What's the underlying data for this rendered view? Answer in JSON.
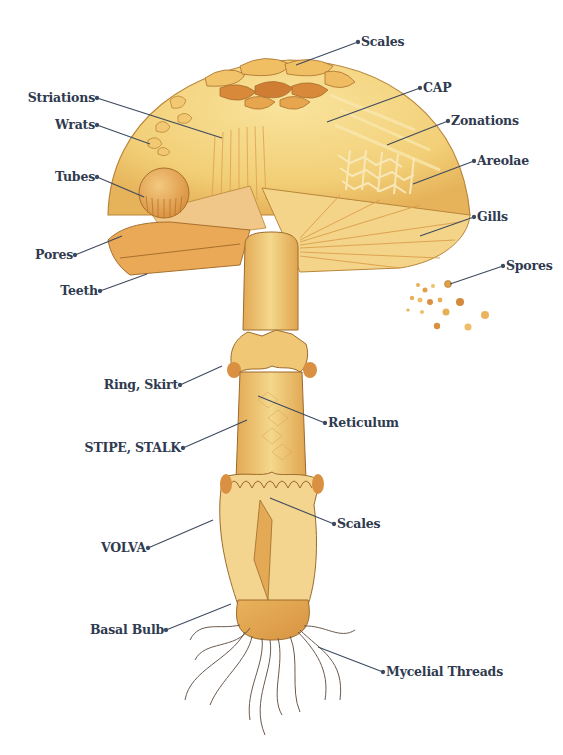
{
  "diagram": {
    "colors": {
      "label_text": "#2f3a4f",
      "leader_line": "#3d4a60",
      "cap_light": "#f7dc8e",
      "cap_mid": "#efc66a",
      "cap_dark": "#d99a45",
      "scale_brown": "#c7772e",
      "stipe": "#eec676",
      "root": "#6b5a4e"
    },
    "labels": [
      {
        "id": "scales-cap",
        "text": "Scales",
        "side": "right"
      },
      {
        "id": "cap",
        "text": "CAP",
        "side": "right"
      },
      {
        "id": "striations",
        "text": "Striations",
        "side": "left"
      },
      {
        "id": "wrats",
        "text": "Wrats",
        "side": "left"
      },
      {
        "id": "zonations",
        "text": "Zonations",
        "side": "right"
      },
      {
        "id": "areolae",
        "text": "Areolae",
        "side": "right"
      },
      {
        "id": "tubes",
        "text": "Tubes",
        "side": "left"
      },
      {
        "id": "gills",
        "text": "Gills",
        "side": "right"
      },
      {
        "id": "pores",
        "text": "Pores",
        "side": "left"
      },
      {
        "id": "spores",
        "text": "Spores",
        "side": "right"
      },
      {
        "id": "teeth",
        "text": "Teeth",
        "side": "left"
      },
      {
        "id": "ring",
        "text": "Ring, Skirt",
        "side": "left"
      },
      {
        "id": "reticulum",
        "text": "Reticulum",
        "side": "right"
      },
      {
        "id": "stipe",
        "text": "STIPE, STALK",
        "side": "left"
      },
      {
        "id": "scales-volva",
        "text": "Scales",
        "side": "right"
      },
      {
        "id": "volva",
        "text": "VOLVA",
        "side": "left"
      },
      {
        "id": "basal-bulb",
        "text": "Basal Bulb",
        "side": "left"
      },
      {
        "id": "mycelial",
        "text": "Mycelial Threads",
        "side": "right"
      }
    ]
  }
}
